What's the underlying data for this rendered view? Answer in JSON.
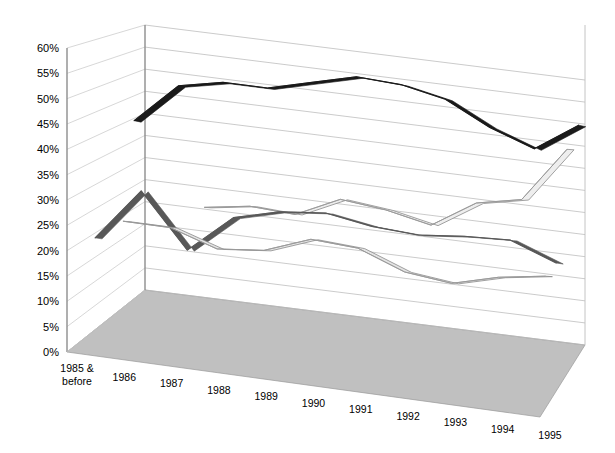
{
  "chart_data": {
    "type": "line",
    "title": "",
    "xlabel": "",
    "ylabel": "",
    "ylim": [
      0,
      60
    ],
    "ytick_step": 5,
    "ytick_suffix": "%",
    "grid": true,
    "legend": "none",
    "projection": "3d-ribbon",
    "categories": [
      "1985 & before",
      "1986",
      "1987",
      "1988",
      "1989",
      "1990",
      "1991",
      "1992",
      "1993",
      "1994",
      "1995"
    ],
    "ytick_labels": [
      "0%",
      "5%",
      "10%",
      "15%",
      "20%",
      "25%",
      "30%",
      "35%",
      "40%",
      "45%",
      "50%",
      "55%",
      "60%"
    ],
    "series": [
      {
        "name": "Series 1",
        "color": "#1a1a1a",
        "style": "thick-black-ribbon",
        "depth": 0.86,
        "values": [
          39.5,
          48.5,
          50.5,
          50.5,
          53.0,
          55.5,
          55.0,
          53.0,
          48.0,
          44.5,
          51.0
        ]
      },
      {
        "name": "Series 2",
        "color": "#eeeeee",
        "style": "light-outlined-ribbon",
        "depth": 0.6,
        "values": [
          null,
          null,
          25.5,
          27.0,
          26.5,
          31.0,
          30.0,
          28.0,
          34.0,
          36.0,
          48.0
        ]
      },
      {
        "name": "Series 3",
        "color": "#585858",
        "style": "dark-gray-ribbon",
        "depth": 0.36,
        "values": [
          19.0,
          30.0,
          19.0,
          27.0,
          29.5,
          30.5,
          29.0,
          28.5,
          29.5,
          30.0,
          26.5
        ]
      },
      {
        "name": "Series 4",
        "color": "#e4e4e4",
        "style": "light-outlined-ribbon",
        "depth": 0.12,
        "values": [
          null,
          26.0,
          26.0,
          23.0,
          24.0,
          27.5,
          27.0,
          23.5,
          22.5,
          25.0,
          26.5
        ]
      }
    ]
  },
  "axes": {
    "y_axis_name": "percent-axis",
    "x_axis_name": "year-axis"
  }
}
